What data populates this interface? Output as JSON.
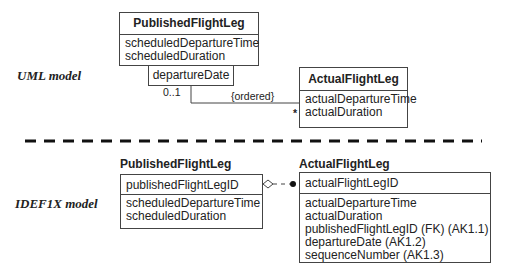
{
  "uml": {
    "label": "UML model",
    "published": {
      "name": "PublishedFlightLeg",
      "attributes": [
        "scheduledDepartureTime",
        "scheduledDuration"
      ]
    },
    "qualifier": "departureDate",
    "multiplicity_source": "0..1",
    "constraint": "{ordered}",
    "multiplicity_target": "*",
    "actual": {
      "name": "ActualFlightLeg",
      "attributes": [
        "actualDepartureTime",
        "actualDuration"
      ]
    }
  },
  "idef1x": {
    "label": "IDEF1X model",
    "published": {
      "name": "PublishedFlightLeg",
      "key": "publishedFlightLegID",
      "attributes": [
        "scheduledDepartureTime",
        "scheduledDuration"
      ]
    },
    "actual": {
      "name": "ActualFlightLeg",
      "key": "actualFlightLegID",
      "attributes": [
        "actualDepartureTime",
        "actualDuration",
        "publishedFlightLegID (FK) (AK1.1)",
        "departureDate (AK1.2)",
        "sequenceNumber (AK1.3)"
      ]
    }
  }
}
